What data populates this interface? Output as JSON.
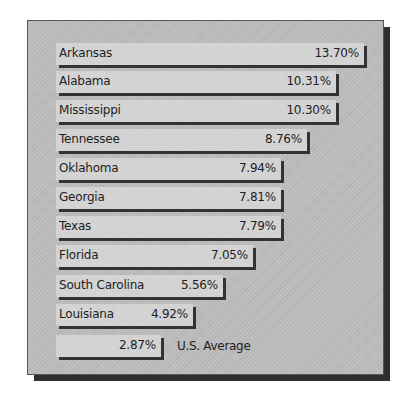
{
  "chart_data": {
    "type": "bar",
    "orientation": "horizontal",
    "title": "",
    "xlabel": "",
    "ylabel": "",
    "categories": [
      "Arkansas",
      "Alabama",
      "Mississippi",
      "Tennessee",
      "Oklahoma",
      "Georgia",
      "Texas",
      "Florida",
      "South Carolina",
      "Louisiana",
      "U.S. Average"
    ],
    "values": [
      13.7,
      10.31,
      10.3,
      8.76,
      7.94,
      7.81,
      7.79,
      7.05,
      5.56,
      4.92,
      2.87
    ],
    "value_labels": [
      "13.70%",
      "10.31%",
      "10.30%",
      "8.76%",
      "7.94%",
      "7.81%",
      "7.79%",
      "7.05%",
      "5.56%",
      "4.92%",
      "2.87%"
    ],
    "grid": false,
    "legend": "none"
  },
  "rows": [
    {
      "label": "Arkansas",
      "value": "13.70%",
      "width": 308,
      "top": 43
    },
    {
      "label": "Alabama",
      "value": "10.31%",
      "width": 280,
      "top": 71
    },
    {
      "label": "Mississippi",
      "value": "10.30%",
      "width": 280,
      "top": 100
    },
    {
      "label": "Tennessee",
      "value": "8.76%",
      "width": 251,
      "top": 129
    },
    {
      "label": "Oklahoma",
      "value": "7.94%",
      "width": 225,
      "top": 158
    },
    {
      "label": "Georgia",
      "value": "7.81%",
      "width": 225,
      "top": 187
    },
    {
      "label": "Texas",
      "value": "7.79%",
      "width": 225,
      "top": 216
    },
    {
      "label": "Florida",
      "value": "7.05%",
      "width": 197,
      "top": 245
    },
    {
      "label": "South Carolina",
      "value": "5.56%",
      "width": 167,
      "top": 275
    },
    {
      "label": "Louisiana",
      "value": "4.92%",
      "width": 137,
      "top": 304
    }
  ],
  "average": {
    "label": "U.S. Average",
    "value": "2.87%",
    "width": 105,
    "top": 335
  }
}
